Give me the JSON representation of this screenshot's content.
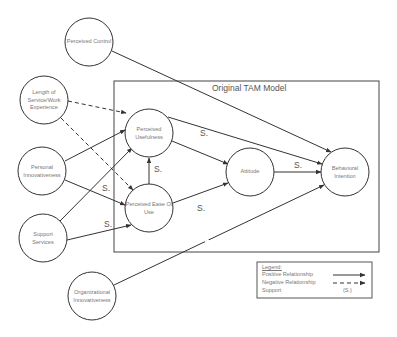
{
  "title": "Original TAM Model",
  "nodes": {
    "perceived_control": "Perceived Control",
    "length_of_service": "Length of Service/Work Experience",
    "personal_innovativeness": "Personal Innovativeness",
    "support_services": "Support Services",
    "organizational_innovativeness": "Organizational Innovativeness",
    "perceived_usefulness": "Perceived Usefulness",
    "perceived_ease_of_use": "Perceived Ease Of Use",
    "attitude": "Attitude",
    "behavioral_intention": "Behavioral Intention"
  },
  "support_label": "S.",
  "edges": [
    {
      "from": "Perceived Control",
      "to": "Behavioral Intention",
      "type": "positive"
    },
    {
      "from": "Length of Service/Work Experience",
      "to": "Perceived Usefulness",
      "type": "negative"
    },
    {
      "from": "Length of Service/Work Experience",
      "to": "Perceived Ease Of Use",
      "type": "negative"
    },
    {
      "from": "Personal Innovativeness",
      "to": "Perceived Usefulness",
      "type": "positive"
    },
    {
      "from": "Personal Innovativeness",
      "to": "Perceived Ease Of Use",
      "type": "positive",
      "support": true
    },
    {
      "from": "Support Services",
      "to": "Perceived Usefulness",
      "type": "positive"
    },
    {
      "from": "Support Services",
      "to": "Perceived Ease Of Use",
      "type": "positive",
      "support": true
    },
    {
      "from": "Perceived Ease Of Use",
      "to": "Perceived Usefulness",
      "type": "positive",
      "support": true
    },
    {
      "from": "Perceived Usefulness",
      "to": "Attitude",
      "type": "positive",
      "support": true
    },
    {
      "from": "Perceived Usefulness",
      "to": "Behavioral Intention",
      "type": "positive"
    },
    {
      "from": "Perceived Ease Of Use",
      "to": "Attitude",
      "type": "positive",
      "support": true
    },
    {
      "from": "Attitude",
      "to": "Behavioral Intention",
      "type": "positive",
      "support": true
    },
    {
      "from": "Organizational Innovativeness",
      "to": "Behavioral Intention",
      "type": "positive"
    }
  ],
  "legend": {
    "title": "Legend:",
    "positive": "Positive Relationship",
    "negative": "Negative Relationship",
    "support": "Support",
    "support_symbol": "(S.)"
  },
  "colors": {
    "line": "#333333",
    "text": "#777777"
  }
}
